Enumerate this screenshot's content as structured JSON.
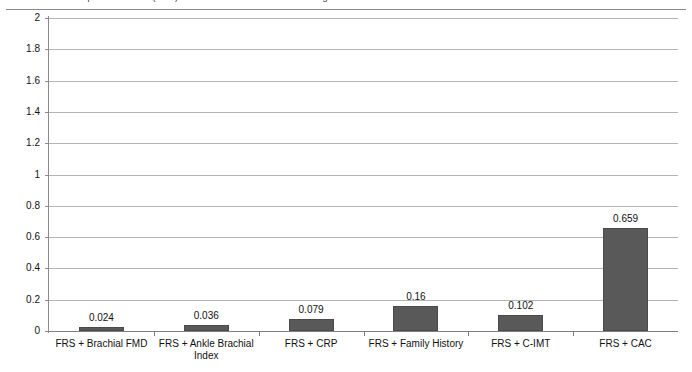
{
  "caption": {
    "text": "Incremental predictive value (delta) of risk markers added to the Framingham Risk Score"
  },
  "chart_data": {
    "type": "bar",
    "title": "",
    "xlabel": "",
    "ylabel": "",
    "ylim": [
      0,
      2
    ],
    "ytick_step": 0.2,
    "grid": true,
    "legend": false,
    "bar_color": "#595959",
    "categories": [
      "FRS + Brachial FMD",
      "FRS + Ankle Brachial Index",
      "FRS + CRP",
      "FRS + Family History",
      "FRS + C-IMT",
      "FRS + CAC"
    ],
    "values": [
      0.024,
      0.036,
      0.079,
      0.16,
      0.102,
      0.659
    ],
    "value_labels": [
      "0.024",
      "0.036",
      "0.079",
      "0.16",
      "0.102",
      "0.659"
    ],
    "ytick_labels": [
      "0",
      "0.2",
      "0.4",
      "0.6",
      "0.8",
      "1",
      "1.2",
      "1.4",
      "1.6",
      "1.8",
      "2"
    ],
    "ytick_values": [
      0,
      0.2,
      0.4,
      0.6,
      0.8,
      1,
      1.2,
      1.4,
      1.6,
      1.8,
      2
    ]
  }
}
